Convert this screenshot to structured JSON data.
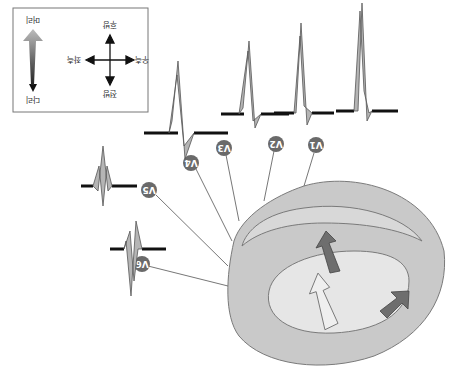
{
  "figure": {
    "orientation": "rotated-180",
    "top_caption_cropped": "",
    "colors": {
      "heart_outer": "#c8c8c8",
      "heart_inner": "#e2e2e2",
      "lumen": "#ebebeb",
      "outline": "#7a7a7a",
      "ecg_fill": "#b5b5b5",
      "ecg_stroke": "#555555",
      "baseline": "#111111",
      "lead_marker": "#6a6a6a",
      "arrow_dark": "#6e6e6e",
      "arrow_light": "#eeeeee"
    }
  },
  "legend": {
    "axis_labels": {
      "head": "머리",
      "legs": "다리",
      "anterior": "전방",
      "posterior": "후방",
      "left": "좌측",
      "right": "우측"
    }
  },
  "leads": [
    {
      "id": "V1",
      "label": "V1",
      "sub": "1"
    },
    {
      "id": "V2",
      "label": "V2",
      "sub": "2"
    },
    {
      "id": "V3",
      "label": "V3",
      "sub": "3"
    },
    {
      "id": "V4",
      "label": "V4",
      "sub": "4"
    },
    {
      "id": "V5",
      "label": "V5",
      "sub": "5"
    },
    {
      "id": "V6",
      "label": "V6",
      "sub": "6"
    }
  ]
}
